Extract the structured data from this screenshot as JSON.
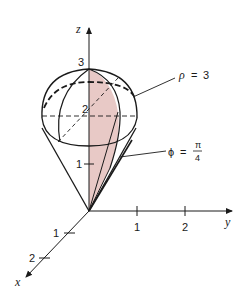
{
  "diagram": {
    "colors": {
      "line": "#1a1a1a",
      "shade": "#e8c9c6",
      "background": "#ffffff"
    },
    "axes": {
      "z": {
        "label": "z",
        "ticks": [
          "1",
          "2",
          "3"
        ]
      },
      "y": {
        "label": "y",
        "ticks": [
          "1",
          "2"
        ]
      },
      "x": {
        "label": "x",
        "ticks": [
          "1",
          "2"
        ]
      }
    },
    "annotations": {
      "sphere": {
        "lhs": "ρ",
        "eq": "=",
        "rhs": "3"
      },
      "cone": {
        "lhs": "ϕ",
        "eq": "=",
        "num": "π",
        "den": "4"
      }
    }
  }
}
